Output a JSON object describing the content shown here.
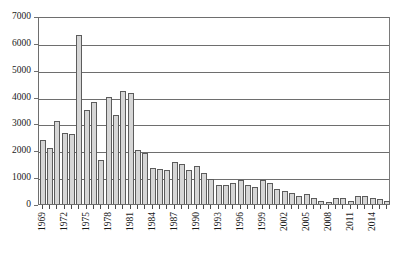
{
  "chart_data": {
    "type": "bar",
    "title": "",
    "subtitle": "",
    "xlabel": "",
    "ylabel": "",
    "ylim": [
      0,
      7000
    ],
    "ytick_step": 1000,
    "ytick_labels": [
      "7000",
      "6000",
      "5000",
      "4000",
      "3000",
      "2000",
      "1000",
      "0"
    ],
    "ytick_values": [
      7000,
      6000,
      5000,
      4000,
      3000,
      2000,
      1000,
      0
    ],
    "grid": true,
    "grid_axis": "y",
    "legend": false,
    "legend_position": "none",
    "xtick_label_interval": 3,
    "xtick_labels_shown": [
      "1969",
      "1972",
      "1975",
      "1978",
      "1981",
      "1984",
      "1987",
      "1990",
      "1993",
      "1996",
      "1999",
      "2002",
      "2005",
      "2008",
      "2011",
      "2014"
    ],
    "categories": [
      "1969",
      "1970",
      "1971",
      "1972",
      "1973",
      "1974",
      "1975",
      "1976",
      "1977",
      "1978",
      "1979",
      "1980",
      "1981",
      "1982",
      "1983",
      "1984",
      "1985",
      "1986",
      "1987",
      "1988",
      "1989",
      "1990",
      "1991",
      "1992",
      "1993",
      "1994",
      "1995",
      "1996",
      "1997",
      "1998",
      "1999",
      "2000",
      "2001",
      "2002",
      "2003",
      "2004",
      "2005",
      "2006",
      "2007",
      "2008",
      "2009",
      "2010",
      "2011",
      "2012",
      "2013",
      "2014",
      "2015",
      "2016"
    ],
    "values": [
      2400,
      2100,
      3100,
      2650,
      2600,
      6300,
      3500,
      3800,
      1650,
      4000,
      3300,
      4200,
      4150,
      2000,
      1900,
      1350,
      1300,
      1250,
      1550,
      1500,
      1250,
      1400,
      1150,
      950,
      700,
      720,
      800,
      900,
      700,
      620,
      900,
      800,
      550,
      500,
      420,
      300,
      380,
      240,
      100,
      60,
      220,
      230,
      100,
      300,
      280,
      230,
      170,
      120
    ],
    "colors": {
      "bar_fill": "#d6d6d6",
      "bar_border": "#5c5c5c",
      "gridline": "#6e6e6e",
      "axis": "#6e6e6e",
      "text": "#1a1a1a",
      "background": "#ffffff"
    }
  }
}
